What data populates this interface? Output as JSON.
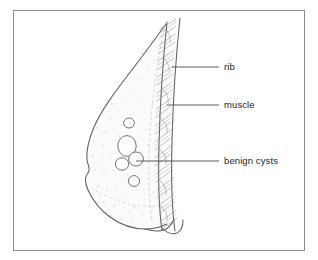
{
  "figure": {
    "frame": {
      "visible": true,
      "color": "#8c8c8c",
      "x": 13,
      "y": 10,
      "width": 292,
      "height": 241
    },
    "background_color": "#ffffff",
    "ink_color": "#5f5f5f",
    "text_color": "#1c1c1c"
  },
  "labels": [
    {
      "id": "rib",
      "text": "rib",
      "text_x": 224,
      "text_y": 70,
      "leader": {
        "x1": 172,
        "y1": 67,
        "x2": 219,
        "y2": 67
      }
    },
    {
      "id": "muscle",
      "text": "muscle",
      "text_x": 224,
      "text_y": 108,
      "leader": {
        "x1": 167,
        "y1": 105,
        "x2": 219,
        "y2": 105
      }
    },
    {
      "id": "benign-cysts",
      "text": "benign cysts",
      "text_x": 224,
      "text_y": 164,
      "leader": {
        "x1": 136,
        "y1": 161,
        "x2": 219,
        "y2": 161
      }
    }
  ],
  "anatomy": {
    "breast_outline_label": "breast profile",
    "nipple_label": "nipple",
    "chest_wall_label": "chest wall",
    "rib_striations_label": "rib and muscle striations",
    "stipple_label": "glandular tissue stipple",
    "cysts": [
      {
        "id": "cyst-small-upper",
        "cx": 129,
        "cy": 123,
        "rx": 5.4,
        "ry": 5.0
      },
      {
        "id": "cyst-large",
        "cx": 127,
        "cy": 146,
        "rx": 9.2,
        "ry": 10.4
      },
      {
        "id": "cyst-pair-left",
        "cx": 122,
        "cy": 164,
        "rx": 6.6,
        "ry": 6.2
      },
      {
        "id": "cyst-pair-right",
        "cx": 136,
        "cy": 159,
        "rx": 7.4,
        "ry": 7.0
      },
      {
        "id": "cyst-small-lower",
        "cx": 134,
        "cy": 181,
        "rx": 5.6,
        "ry": 5.4
      }
    ]
  }
}
